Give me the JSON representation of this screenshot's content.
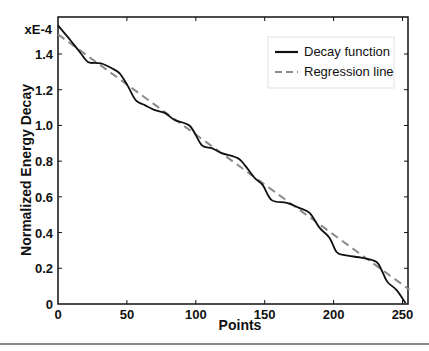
{
  "chart_data": {
    "type": "line",
    "title": "",
    "xlabel": "Points",
    "ylabel": "Normalized Energy Decay",
    "y_multiplier_label": "xE-4",
    "xlim": [
      0,
      256
    ],
    "ylim": [
      0,
      1.6
    ],
    "x_ticks": [
      0,
      50,
      100,
      150,
      200,
      250
    ],
    "x_tick_labels": [
      "0",
      "50",
      "100",
      "150",
      "200",
      "250"
    ],
    "y_ticks": [
      0,
      0.2,
      0.4,
      0.6,
      0.8,
      1.0,
      1.2,
      1.4
    ],
    "y_tick_labels": [
      "0",
      "0.2",
      "0.4",
      "0.6",
      "0.8",
      "1.0",
      "1.2",
      "1.4"
    ],
    "grid": false,
    "legend_position": "upper right",
    "series": [
      {
        "name": "Decay function",
        "style": "solid",
        "color": "#111111",
        "x": [
          0,
          8.7,
          15.9,
          21.7,
          27.5,
          32.6,
          39.1,
          44.9,
          50.7,
          56.5,
          63,
          70.3,
          77.5,
          84.8,
          95.7,
          104.3,
          111.6,
          118.8,
          130.4,
          135.5,
          142.8,
          148.6,
          155.1,
          166,
          175.4,
          182.6,
          189.9,
          197.1,
          202.2,
          208,
          221,
          231.2,
          235.5,
          239.1,
          245.7,
          252.2
        ],
        "values": [
          1.56,
          1.48,
          1.41,
          1.355,
          1.35,
          1.344,
          1.32,
          1.29,
          1.22,
          1.14,
          1.114,
          1.086,
          1.07,
          1.03,
          0.997,
          0.89,
          0.873,
          0.845,
          0.817,
          0.778,
          0.705,
          0.666,
          0.582,
          0.566,
          0.537,
          0.51,
          0.426,
          0.37,
          0.291,
          0.274,
          0.258,
          0.235,
          0.179,
          0.123,
          0.078,
          0.006
        ]
      },
      {
        "name": "Regression line",
        "style": "dashed",
        "color": "#8a8a8a",
        "x": [
          0,
          255
        ],
        "values": [
          1.51,
          0.08
        ]
      }
    ]
  },
  "legend": {
    "items": [
      {
        "label": "Decay function"
      },
      {
        "label": "Regression line"
      }
    ]
  }
}
